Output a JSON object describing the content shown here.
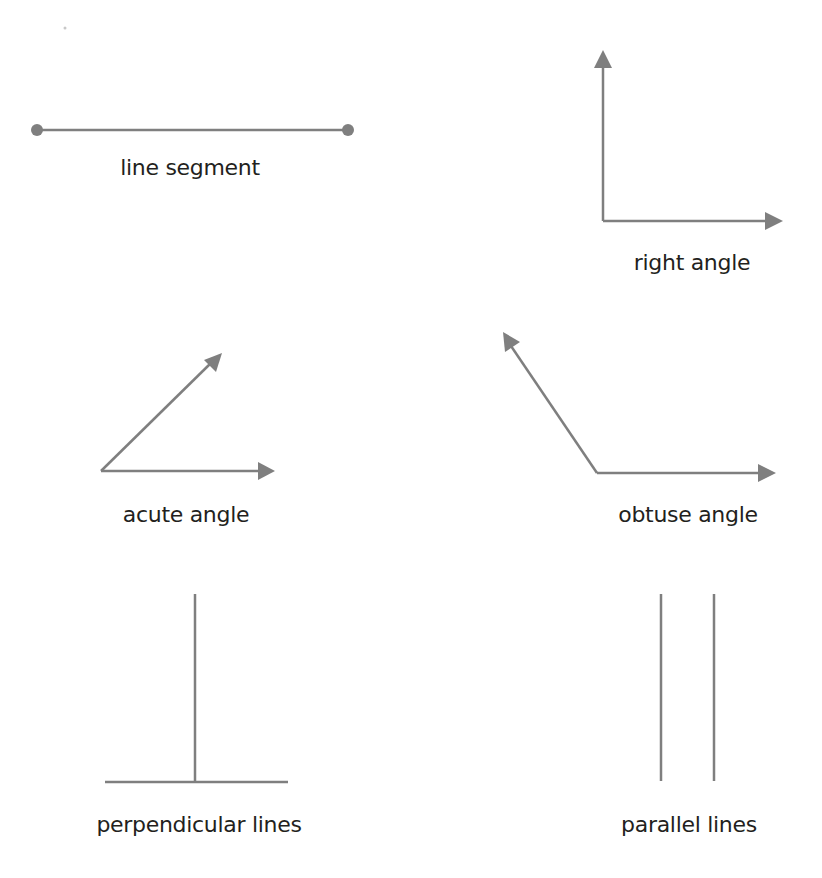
{
  "diagram": {
    "stroke_color": "#7f7f7f",
    "text_color": "#231f20",
    "figures": [
      {
        "id": "line-segment",
        "label": "line segment"
      },
      {
        "id": "right-angle",
        "label": "right angle"
      },
      {
        "id": "acute-angle",
        "label": "acute angle"
      },
      {
        "id": "obtuse-angle",
        "label": "obtuse angle"
      },
      {
        "id": "perpendicular-lines",
        "label": "perpendicular lines"
      },
      {
        "id": "parallel-lines",
        "label": "parallel lines"
      }
    ]
  }
}
